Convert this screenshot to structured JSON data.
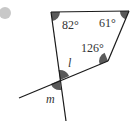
{
  "diagram": {
    "bullet": {
      "color": "#c8c8c8"
    },
    "angles": {
      "top_left": "82°",
      "top_right": "61°",
      "right": "126°",
      "l": "l",
      "m": "m"
    },
    "colors": {
      "line": "#1a1a1a",
      "sector": "#5a5a5a"
    }
  }
}
